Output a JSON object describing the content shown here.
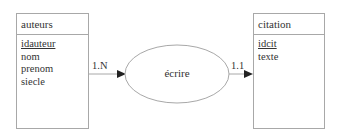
{
  "entities": {
    "left": {
      "name": "auteurs",
      "key": "idauteur",
      "attributes": [
        "nom",
        "prenom",
        "siecle"
      ]
    },
    "right": {
      "name": "citation",
      "key": "idcit",
      "attributes": [
        "texte"
      ]
    }
  },
  "relationship": {
    "name": "écrire",
    "left_cardinality": "1.N",
    "right_cardinality": "1.1"
  },
  "colors": {
    "line": "#a8a8a8",
    "arrow": "#222222",
    "text": "#333333"
  }
}
